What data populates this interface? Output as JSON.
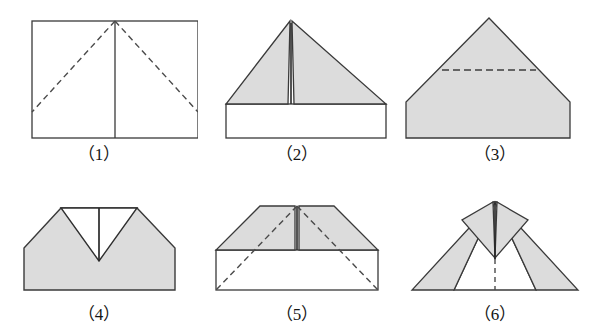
{
  "document": {
    "title": "Paper Airplane Folding Steps",
    "background_color": "#ffffff",
    "width": 594,
    "height": 334
  },
  "style": {
    "fill_gray": "#dcdcdc",
    "stroke_dark": "#3a3a3a",
    "stroke_light": "#5a5a5a",
    "dash_color": "#4a4a4a",
    "paper_white": "#ffffff"
  },
  "figures": [
    {
      "id": "step-1",
      "caption": "（1）",
      "number": "1",
      "description": "Flat rectangular sheet of paper with a solid vertical centre crease and two dashed diagonal fold lines running from the top centre point down to the left and right edges.",
      "shape": "rectangle",
      "filled": false,
      "solid_lines": [
        "rectangle-outline",
        "vertical-centre-crease"
      ],
      "dashed_lines": [
        "top-centre-to-left-edge",
        "top-centre-to-right-edge"
      ]
    },
    {
      "id": "step-2",
      "caption": "（2）",
      "number": "2",
      "description": "Two top corners folded down to the centre forming a shaded triangle above an unfolded white rectangle; a narrow slit shows where the two flaps meet at the centre.",
      "shape": "triangle-over-rectangle",
      "filled": true,
      "solid_lines": [
        "triangle-outline",
        "rectangle-outline",
        "centre-slit"
      ],
      "dashed_lines": []
    },
    {
      "id": "step-3",
      "caption": "（3）",
      "number": "3",
      "description": "The lower rectangular flap has been folded up, producing a shaded pentagon (house shape); a horizontal dashed line marks the next fold across the upper triangle.",
      "shape": "pentagon",
      "filled": true,
      "solid_lines": [
        "pentagon-outline"
      ],
      "dashed_lines": [
        "horizontal-fold-line"
      ]
    },
    {
      "id": "step-4",
      "caption": "（4）",
      "number": "4",
      "description": "The tip has been folded down, leaving a flat top with a V-shaped notch in the middle and a short vertical crease running to the point of the V.",
      "shape": "notched-pentagon",
      "filled": true,
      "solid_lines": [
        "outline",
        "v-notch",
        "vertical-crease"
      ],
      "dashed_lines": []
    },
    {
      "id": "step-5",
      "caption": "（5）",
      "number": "5",
      "description": "A shaded trapezoid over a white rectangle, with dashed diagonal lines from the top centre out to the bottom two corners showing where the wings will be folded.",
      "shape": "trapezoid-over-rectangle",
      "filled": true,
      "solid_lines": [
        "trapezoid-outline",
        "rectangle-outline",
        "centre-slit"
      ],
      "dashed_lines": [
        "centre-to-bottom-left",
        "centre-to-bottom-right"
      ]
    },
    {
      "id": "step-6",
      "caption": "（6）",
      "number": "6",
      "description": "The finished paper aeroplane seen from above: two wide swept-back shaded wings either side of a white central body, with a vertical dashed centre line.",
      "shape": "paper-plane",
      "filled": true,
      "solid_lines": [
        "wing-outlines",
        "body-outline",
        "nose-crease"
      ],
      "dashed_lines": [
        "vertical-centre-line"
      ]
    }
  ]
}
